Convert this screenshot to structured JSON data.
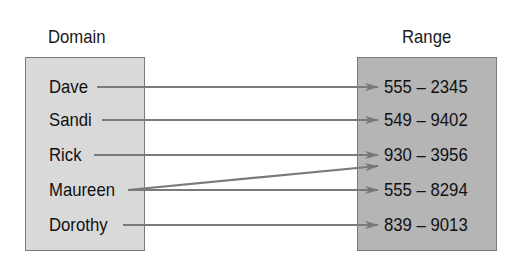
{
  "diagram": {
    "type": "mapping",
    "domain_label": "Domain",
    "range_label": "Range",
    "domain": [
      {
        "label": "Dave"
      },
      {
        "label": "Sandi"
      },
      {
        "label": "Rick"
      },
      {
        "label": "Maureen"
      },
      {
        "label": "Dorothy"
      }
    ],
    "range": [
      {
        "label": "555 – 2345"
      },
      {
        "label": "549 – 9402"
      },
      {
        "label": "930 – 3956"
      },
      {
        "label": "555 – 8294"
      },
      {
        "label": "839 – 9013"
      }
    ],
    "mappings": [
      {
        "from": "Dave",
        "to": "555 – 2345"
      },
      {
        "from": "Sandi",
        "to": "549 – 9402"
      },
      {
        "from": "Rick",
        "to": "930 – 3956"
      },
      {
        "from": "Maureen",
        "to": "930 – 3956"
      },
      {
        "from": "Maureen",
        "to": "555 – 8294"
      },
      {
        "from": "Dorothy",
        "to": "839 – 9013"
      }
    ],
    "colors": {
      "domain_fill": "#d9d9d9",
      "range_fill": "#b5b5b5",
      "arrow": "#777777",
      "border": "#7a7a7a"
    }
  }
}
